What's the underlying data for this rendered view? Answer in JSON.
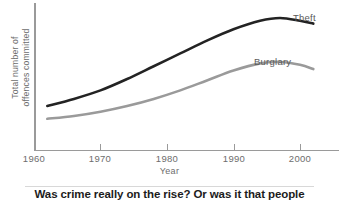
{
  "chart_data": {
    "type": "line",
    "title": "",
    "xlabel": "Year",
    "ylabel": "Total number of offences committed",
    "ylabel_line1": "Total number of",
    "ylabel_line2": "offences committed",
    "xlim": [
      1960,
      2002
    ],
    "ylim": [
      0,
      100
    ],
    "grid": false,
    "legend": "inline-labels",
    "xticks": [
      {
        "label": "1960",
        "value": 1960
      },
      {
        "label": "1970",
        "value": 1970
      },
      {
        "label": "1980",
        "value": 1980
      },
      {
        "label": "1990",
        "value": 1990
      },
      {
        "label": "2000",
        "value": 2000
      }
    ],
    "yticks": [],
    "x": [
      1962,
      1966,
      1970,
      1974,
      1978,
      1982,
      1986,
      1990,
      1994,
      1997,
      2000,
      2002
    ],
    "series": [
      {
        "name": "Theft",
        "color": "#232323",
        "values": [
          31,
          36,
          42,
          50,
          59,
          68,
          77,
          85,
          91,
          93,
          91,
          89
        ]
      },
      {
        "name": "Burglary",
        "color": "#9a9a9a",
        "values": [
          22,
          24,
          27,
          31,
          36,
          42,
          49,
          56,
          61,
          62,
          60,
          57
        ]
      }
    ],
    "annotations": [
      {
        "text": "Theft",
        "series": "Theft"
      },
      {
        "text": "Burglary",
        "series": "Burglary"
      }
    ]
  },
  "caption": {
    "text": "Was crime really on the rise? Or was it that people"
  },
  "colors": {
    "theft": "#232323",
    "burglary": "#9a9a9a",
    "axis": "#9a9a9a",
    "text": "#6d6d6d",
    "caption": "#1c1c1c"
  }
}
